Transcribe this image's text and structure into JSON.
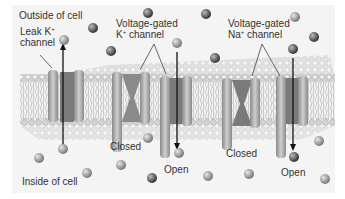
{
  "diagram": {
    "labels": {
      "outside": "Outside of cell",
      "inside": "Inside of cell",
      "leak_k_line1": "Leak K",
      "leak_k_sup": "+",
      "leak_k_line2": "channel",
      "vg_k_line1": "Voltage-gated",
      "vg_k_line2_ion": "K",
      "vg_k_sup": "+",
      "vg_k_line2_rest": " channel",
      "vg_na_line1": "Voltage-gated",
      "vg_na_line2_ion": "Na",
      "vg_na_sup": "+",
      "vg_na_line2_rest": " channel",
      "k_closed": "Closed",
      "k_open": "Open",
      "na_closed": "Closed",
      "na_open": "Open"
    },
    "colors": {
      "background": "#f2f2f2",
      "membrane": "#c8c8c8",
      "channel": "#a8a8a8",
      "ion_dark": "#555555",
      "ion_light": "#9a9a9a",
      "arrow": "#111111"
    }
  }
}
